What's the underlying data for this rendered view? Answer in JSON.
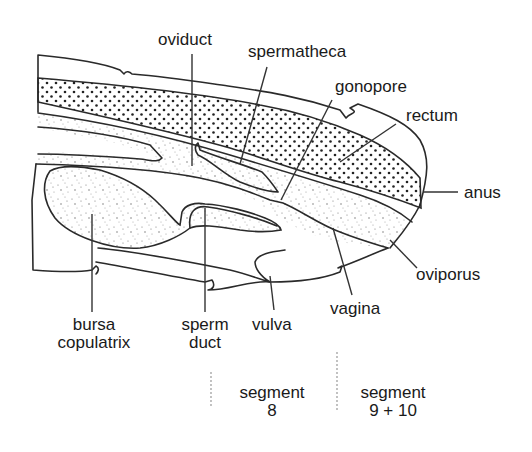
{
  "diagram": {
    "labels": {
      "oviduct": "oviduct",
      "spermatheca": "spermatheca",
      "gonopore": "gonopore",
      "rectum": "rectum",
      "anus": "anus",
      "oviporus": "oviporus",
      "vagina": "vagina",
      "vulva": "vulva",
      "sperm_duct_line1": "sperm",
      "sperm_duct_line2": "duct",
      "bursa_line1": "bursa",
      "bursa_line2": "copulatrix"
    },
    "segments": [
      {
        "line1": "segment",
        "line2": "8"
      },
      {
        "line1": "segment",
        "line2": "9 + 10"
      }
    ],
    "fills": {
      "rectum_pattern": "coarse-dots",
      "reproductive_pattern": "fine-stipple"
    },
    "colors": {
      "stroke": "#2a2a2a",
      "text": "#1a1a1a",
      "background": "#ffffff"
    }
  }
}
